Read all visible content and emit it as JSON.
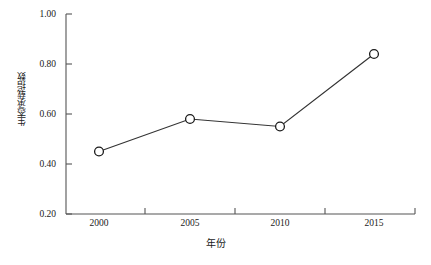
{
  "chart_data": {
    "type": "line",
    "title": "",
    "xlabel": "年份",
    "ylabel": "生态承载指数",
    "categories": [
      "2000",
      "2005",
      "2010",
      "2015"
    ],
    "x": [
      2000,
      2005,
      2010,
      2015
    ],
    "values": [
      0.45,
      0.58,
      0.55,
      0.84
    ],
    "series": [
      {
        "name": "生态承载指数",
        "values": [
          0.45,
          0.58,
          0.55,
          0.84
        ]
      }
    ],
    "ylim": [
      0.2,
      1.0
    ],
    "ytick_labels": [
      "1.00",
      "0.80",
      "0.60",
      "0.40",
      "0.20"
    ],
    "ytick_values": [
      1.0,
      0.8,
      0.6,
      0.4,
      0.2
    ],
    "xtick_labels": [
      "2000",
      "2005",
      "2010",
      "2015"
    ],
    "grid": false,
    "legend": false,
    "legend_position": "none",
    "marker": "open-circle",
    "line_color": "#333333",
    "marker_fill": "#ffffff",
    "marker_stroke": "#1a1a1a",
    "axis_color": "#555555",
    "background": "#ffffff"
  },
  "axes": {
    "y_title": "生态承载指数",
    "x_title": "年份",
    "y_ticks": [
      {
        "label": "1.00",
        "value": 1.0
      },
      {
        "label": "0.80",
        "value": 0.8
      },
      {
        "label": "0.60",
        "value": 0.6
      },
      {
        "label": "0.40",
        "value": 0.4
      },
      {
        "label": "0.20",
        "value": 0.2
      }
    ],
    "x_ticks": [
      {
        "label": "2000"
      },
      {
        "label": "2005"
      },
      {
        "label": "2010"
      },
      {
        "label": "2015"
      }
    ]
  }
}
